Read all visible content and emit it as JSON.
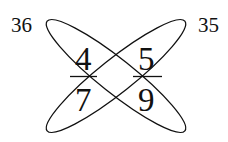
{
  "diagram": {
    "type": "crossed-ellipses-fraction-puzzle",
    "corner_labels": {
      "top_left": "36",
      "top_right": "35"
    },
    "numbers": {
      "top_left": "4",
      "top_right": "5",
      "bottom_left": "7",
      "bottom_right": "9"
    },
    "colors": {
      "stroke": "#111111",
      "text": "#111111",
      "background": "#ffffff"
    }
  }
}
